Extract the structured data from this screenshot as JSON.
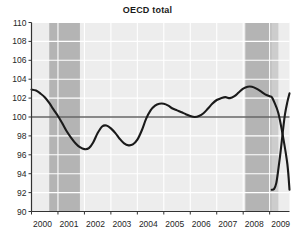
{
  "chart_data": {
    "type": "line",
    "title": "OECD total",
    "xlabel": "",
    "ylabel": "",
    "xlim": [
      2000.0,
      2009.75
    ],
    "ylim": [
      90,
      110
    ],
    "yticks": [
      90,
      92,
      94,
      96,
      98,
      100,
      102,
      104,
      106,
      108,
      110
    ],
    "xticks": [
      2000,
      2001,
      2002,
      2003,
      2004,
      2005,
      2006,
      2007,
      2008,
      2009
    ],
    "xtick_labels": [
      "2000",
      "2001",
      "2002",
      "2003",
      "2004",
      "2005",
      "2006",
      "2007",
      "2008",
      "2009"
    ],
    "grid": true,
    "grid_color": "#ffffff",
    "plot_background": "#ededed",
    "legend": null,
    "reference_line": {
      "value": 100,
      "orientation": "horizontal",
      "color": "#1a1a1a"
    },
    "shaded_bands": [
      {
        "label": "recession-band-1",
        "x0": 2000.67,
        "x1": 2001.83,
        "color": "#b4b4b4"
      },
      {
        "label": "recession-band-2",
        "x0": 2008.08,
        "x1": 2009.08,
        "color": "#b4b4b4"
      },
      {
        "label": "recession-band-3",
        "x0": 2009.08,
        "x1": 2009.33,
        "color": "#cdcdcd"
      }
    ],
    "series": [
      {
        "name": "OECD total",
        "color": "#1a1a1a",
        "x": [
          2000.0,
          2000.17,
          2000.33,
          2000.5,
          2000.67,
          2000.83,
          2001.0,
          2001.17,
          2001.33,
          2001.5,
          2001.67,
          2001.83,
          2002.0,
          2002.17,
          2002.33,
          2002.5,
          2002.67,
          2002.83,
          2003.0,
          2003.17,
          2003.33,
          2003.5,
          2003.67,
          2003.83,
          2004.0,
          2004.17,
          2004.33,
          2004.5,
          2004.67,
          2004.83,
          2005.0,
          2005.17,
          2005.33,
          2005.5,
          2005.67,
          2005.83,
          2006.0,
          2006.17,
          2006.33,
          2006.5,
          2006.67,
          2006.83,
          2007.0,
          2007.17,
          2007.33,
          2007.5,
          2007.67,
          2007.83,
          2008.0,
          2008.17,
          2008.33,
          2008.5,
          2008.67,
          2008.83,
          2009.0,
          2009.08,
          2009.17,
          2009.33,
          2009.5,
          2009.67,
          2009.75
        ],
        "y": [
          102.9,
          102.8,
          102.5,
          102.1,
          101.5,
          100.8,
          100.1,
          99.3,
          98.5,
          97.8,
          97.2,
          96.8,
          96.6,
          96.7,
          97.3,
          98.3,
          99.0,
          99.1,
          98.8,
          98.3,
          97.7,
          97.2,
          97.0,
          97.1,
          97.6,
          98.6,
          99.8,
          100.7,
          101.2,
          101.4,
          101.4,
          101.2,
          100.9,
          100.7,
          100.5,
          100.3,
          100.1,
          100.0,
          100.1,
          100.4,
          100.9,
          101.4,
          101.8,
          102.0,
          102.1,
          102.0,
          102.2,
          102.6,
          103.0,
          103.2,
          103.2,
          103.0,
          102.7,
          102.4,
          102.2,
          102.1,
          101.6,
          100.4,
          98.0,
          95.0,
          92.3
        ],
        "tail_x": [
          2009.08,
          2009.17,
          2009.25,
          2009.33,
          2009.42,
          2009.5,
          2009.58,
          2009.67,
          2009.75
        ],
        "tail_y": [
          92.3,
          92.4,
          93.0,
          94.5,
          96.5,
          98.5,
          100.3,
          101.6,
          102.5
        ],
        "key_points": {
          "start_2000": 102.9,
          "trough_2002": 96.6,
          "local_peak_2002": 99.1,
          "trough_2003": 97.0,
          "peak_2004": 101.4,
          "dip_2005": 100.0,
          "peak_2007": 103.2,
          "trough_2009": 92.3,
          "end_2009": 102.5
        }
      }
    ]
  }
}
